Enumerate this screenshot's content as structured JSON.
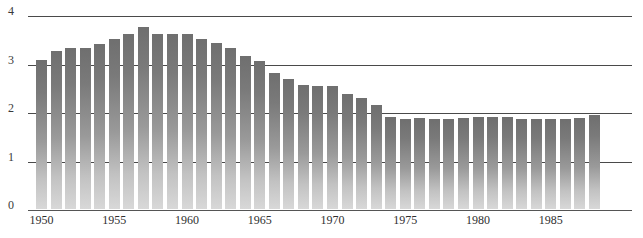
{
  "chart_data": {
    "type": "bar",
    "title": "",
    "subtitle": "",
    "xlabel": "",
    "ylabel": "",
    "xlim": [
      1949.5,
      1988.5
    ],
    "ylim": [
      0,
      4
    ],
    "grid": true,
    "legend": null,
    "y_ticks": [
      "0",
      "1",
      "2",
      "3",
      "4"
    ],
    "y_tick_values": [
      0,
      1,
      2,
      3,
      4
    ],
    "x_ticks": [
      "1950",
      "1955",
      "1960",
      "1965",
      "1970",
      "1975",
      "1980",
      "1985"
    ],
    "x_tick_values": [
      1950,
      1955,
      1960,
      1965,
      1970,
      1975,
      1980,
      1985
    ],
    "categories": [
      "1950",
      "1951",
      "1952",
      "1953",
      "1954",
      "1955",
      "1956",
      "1957",
      "1958",
      "1959",
      "1960",
      "1961",
      "1962",
      "1963",
      "1964",
      "1965",
      "1966",
      "1967",
      "1968",
      "1969",
      "1970",
      "1971",
      "1972",
      "1973",
      "1974",
      "1975",
      "1976",
      "1977",
      "1978",
      "1979",
      "1980",
      "1981",
      "1982",
      "1983",
      "1984",
      "1985",
      "1986",
      "1987",
      "1988"
    ],
    "values": [
      3.08,
      3.25,
      3.32,
      3.32,
      3.4,
      3.51,
      3.6,
      3.75,
      3.6,
      3.6,
      3.6,
      3.51,
      3.42,
      3.32,
      3.16,
      3.05,
      2.8,
      2.68,
      2.55,
      2.53,
      2.53,
      2.37,
      2.29,
      2.15,
      1.9,
      1.85,
      1.88,
      1.85,
      1.85,
      1.88,
      1.9,
      1.9,
      1.9,
      1.85,
      1.86,
      1.85,
      1.85,
      1.88,
      1.93
    ],
    "bar_color_top": "#6f6f6f",
    "bar_color_bottom": "#d8d8d8",
    "gridline_color": "#4a4a4a",
    "background_color": "#ffffff"
  }
}
